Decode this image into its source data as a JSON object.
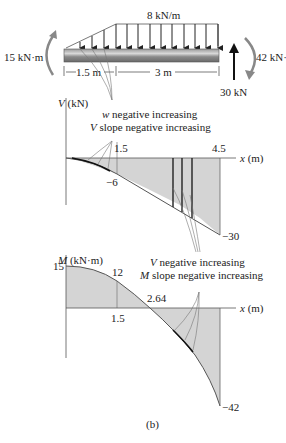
{
  "loading_diagram": {
    "distributed_load_label": "8 kN/m",
    "left_moment_label": "15 kN·m",
    "right_moment_label": "42 kN·",
    "reaction_label": "30 kN",
    "dim_left": "1.5 m",
    "dim_right": "3 m"
  },
  "shear_diagram": {
    "axis_label_var": "V",
    "axis_label_unit": "(kN)",
    "x_axis_label_var": "x",
    "x_axis_label_unit": "(m)",
    "annotation_line1_var": "w",
    "annotation_line1_text": "negative increasing",
    "annotation_line2_var": "V",
    "annotation_line2_text": "slope negative increasing",
    "tick_1_5": "1.5",
    "tick_4_5": "4.5",
    "value_minus6": "−6",
    "value_minus30": "−30"
  },
  "moment_diagram": {
    "axis_label_var": "M",
    "axis_label_unit": "(kN·m)",
    "x_axis_label_var": "x",
    "x_axis_label_unit": "(m)",
    "annotation_line1_var": "V",
    "annotation_line1_text": "negative increasing",
    "annotation_line2_var": "M",
    "annotation_line2_text": "slope negative increasing",
    "value_15": "15",
    "value_12": "12",
    "value_2_64": "2.64",
    "tick_1_5": "1.5",
    "value_minus42": "−42"
  },
  "caption": "(b)"
}
